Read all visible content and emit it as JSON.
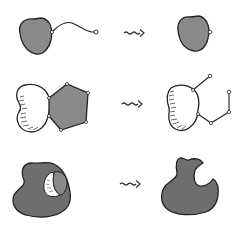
{
  "diagram": {
    "type": "conformational-change-schematic",
    "rows": [
      {
        "id": "row-1",
        "before": "globular-domain-with-flexible-tail",
        "transition": "squiggly-arrow",
        "after": "globular-domain-tail-retracted",
        "description": "A globular domain with a flexible extended tail collapses to a compact domain"
      },
      {
        "id": "row-2",
        "before": "two-domain-complex-lobed-plus-pentagon",
        "transition": "squiggly-arrow",
        "after": "lobed-domain-with-released-linear-chain",
        "description": "A folded pentagonal domain bound to a lobed domain unfolds into an extended chain"
      },
      {
        "id": "row-3",
        "before": "large-domain-with-bound-ligand-in-pocket",
        "transition": "squiggly-arrow",
        "after": "large-domain-with-empty-pocket",
        "description": "A ligand bound in a pocket of a large domain is released, leaving an empty binding cleft"
      }
    ],
    "colors": {
      "fill_gray": "#8a8a8a",
      "fill_dark_gray": "#6e6e6e",
      "outline": "#222222",
      "node_fill": "#ffffff",
      "background": "#ffffff"
    }
  }
}
